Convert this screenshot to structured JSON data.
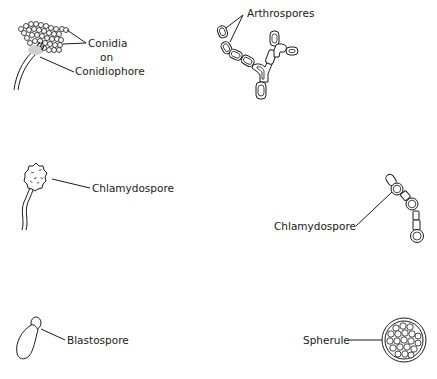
{
  "diagram": {
    "type": "fungal spore types illustration",
    "panels": [
      {
        "id": "conidia",
        "label_lines": [
          "Conidia",
          "on",
          "Conidiophore"
        ]
      },
      {
        "id": "arthrospores",
        "label": "Arthrospores"
      },
      {
        "id": "chlamydospore-terminal",
        "label": "Chlamydospore"
      },
      {
        "id": "chlamydospore-intercalary",
        "label": "Chlamydospore"
      },
      {
        "id": "blastospore",
        "label": "Blastospore"
      },
      {
        "id": "spherule",
        "label": "Spherule"
      }
    ],
    "colors": {
      "ink": "#1a1a1a",
      "background": "#ffffff"
    }
  }
}
